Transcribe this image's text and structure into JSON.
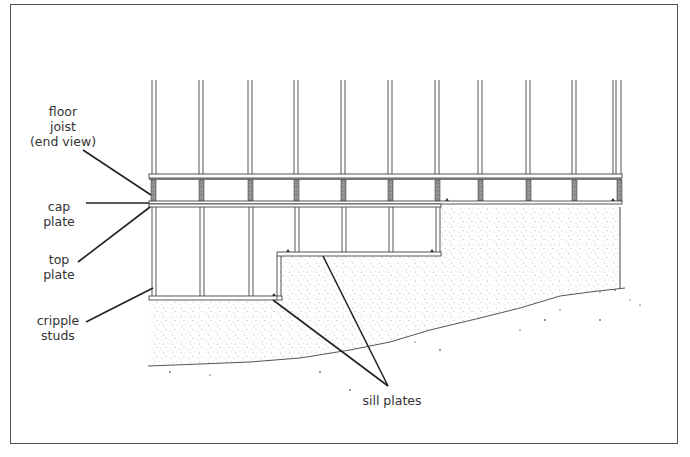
{
  "diagram": {
    "labels": {
      "floor_joist": [
        "floor",
        "joist",
        "(end view)"
      ],
      "cap_plate": [
        "cap",
        "plate"
      ],
      "top_plate": [
        "top",
        "plate"
      ],
      "cripple_studs": [
        "cripple",
        "studs"
      ],
      "sill_plates": "sill plates"
    },
    "colors": {
      "line": "#333333",
      "frame_border": "#555555",
      "stipple": "#9a9a9a",
      "background": "#ffffff"
    }
  }
}
